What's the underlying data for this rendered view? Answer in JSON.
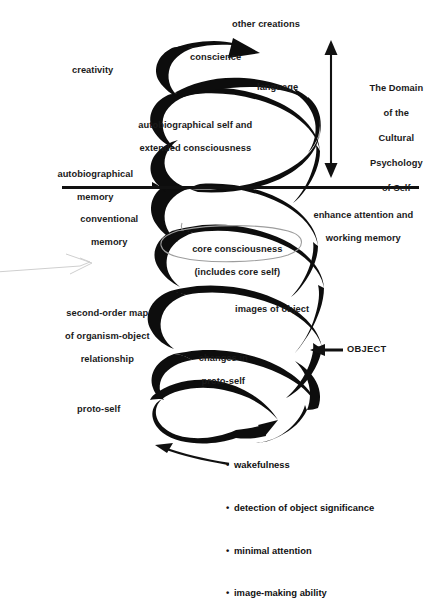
{
  "diagram": {
    "type": "spiral-flow-diagram",
    "colors": {
      "ink": "#111111",
      "ribbon": "#0d0d0d",
      "ellipse": "#9a9a9a",
      "faint": "#c9c9c9"
    },
    "divider": {
      "name": "horizontal-divider-line",
      "y": 187,
      "x1": 62,
      "x2": 419
    },
    "domain_arrow": {
      "label_lines": [
        "The Domain",
        "of the",
        "Cultural",
        "Psychology",
        "of Self"
      ],
      "direction": "double-vertical"
    },
    "object_arrow": {
      "label": "OBJECT",
      "direction": "left"
    },
    "spiral": {
      "top_arrowhead": "up-right",
      "bottom_tip": "point",
      "loops": 5
    },
    "core_ellipse": {
      "lines": [
        "core consciousness",
        "(includes core self)"
      ]
    },
    "labels": [
      {
        "id": "other-creations",
        "text": "other creations"
      },
      {
        "id": "conscience",
        "text": "conscience"
      },
      {
        "id": "creativity",
        "text": "creativity"
      },
      {
        "id": "language",
        "text": "language"
      },
      {
        "id": "autobiographical-self",
        "lines": [
          "autobiographical self and",
          "extended consciousness"
        ]
      },
      {
        "id": "autobiographical-memory",
        "lines": [
          "autobiographical",
          "memory"
        ]
      },
      {
        "id": "conventional-memory",
        "lines": [
          "conventional",
          "memory"
        ]
      },
      {
        "id": "enhance-attention",
        "lines": [
          "enhance attention and",
          "working memory"
        ]
      },
      {
        "id": "second-order-map",
        "lines": [
          "second-order map",
          "of organism-object",
          "relationship"
        ]
      },
      {
        "id": "images-of-object",
        "text": "images of object"
      },
      {
        "id": "changes-in-proto-self",
        "lines": [
          "changes in",
          "proto-self"
        ]
      },
      {
        "id": "proto-self",
        "text": "proto-self"
      }
    ],
    "bullet_list": [
      "wakefulness",
      "detection of object significance",
      "minimal attention",
      "image-making ability"
    ],
    "text": {
      "other_creations": "other creations",
      "conscience": "conscience",
      "creativity": "creativity",
      "language": "language",
      "autobio_self_1": "autobiographical self and",
      "autobio_self_2": "extended consciousness",
      "autobio_mem_1": "autobiographical",
      "autobio_mem_2": "memory",
      "conv_mem_1": "conventional",
      "conv_mem_2": "memory",
      "enhance_1": "enhance attention and",
      "enhance_2": "working memory",
      "core_1": "core consciousness",
      "core_2": "(includes core self)",
      "somap_1": "second-order map",
      "somap_2": "of organism-object",
      "somap_3": "relationship",
      "images_of_object": "images of object",
      "changes_1": "changes in",
      "changes_2": "proto-self",
      "proto_self": "proto-self",
      "object": "OBJECT",
      "domain_1": "The Domain",
      "domain_2": "of the",
      "domain_3": "Cultural",
      "domain_4": "Psychology",
      "domain_5": "of Self",
      "bullet_1": "wakefulness",
      "bullet_2": "detection of object significance",
      "bullet_3": "minimal attention",
      "bullet_4": "image-making ability",
      "bullet_mark": "•"
    }
  }
}
